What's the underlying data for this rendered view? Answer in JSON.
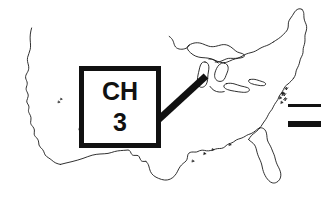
{
  "figure": {
    "name": "us-map-channel-callout",
    "background_color": "#ffffff",
    "ink_color": "#111111",
    "width": 321,
    "height": 211
  },
  "map": {
    "region_label": "United States",
    "outline_color": "#1a1a1a",
    "outline_width": 0.9,
    "fill": "#ffffff"
  },
  "callout": {
    "line1": "CH",
    "line2": "3",
    "border_color": "#111111",
    "border_width": 5,
    "fill": "#ffffff",
    "points_to": "Michigan"
  },
  "leader": {
    "color": "#111111",
    "width": 7,
    "from_x": 157,
    "from_y": 121,
    "to_x": 206,
    "to_y": 76
  },
  "rules": [
    {
      "label": "thin-rule",
      "thickness": 3,
      "x": 288,
      "y": 104,
      "length": 33,
      "color": "#111111"
    },
    {
      "label": "thick-rule",
      "thickness": 6,
      "x": 288,
      "y": 121,
      "length": 33,
      "color": "#111111"
    }
  ]
}
